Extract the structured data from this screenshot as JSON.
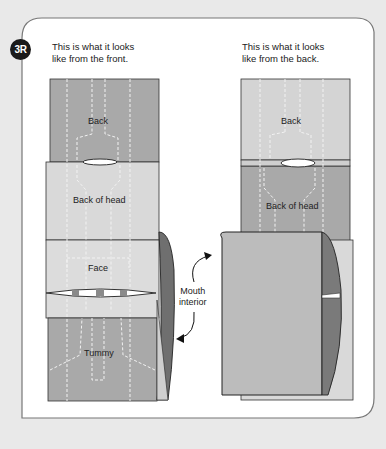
{
  "step": {
    "badge": "3R"
  },
  "front": {
    "caption_line1": "This is what it looks",
    "caption_line2": "like from the front.",
    "labels": {
      "back": "Back",
      "back_of_head": "Back of head",
      "face": "Face",
      "tummy": "Tummy"
    }
  },
  "back_view": {
    "caption_line1": "This is what it looks",
    "caption_line2": "like from the back.",
    "labels": {
      "back": "Back",
      "back_of_head": "Back of head"
    }
  },
  "annotation": {
    "line1": "Mouth",
    "line2": "interior"
  },
  "colors": {
    "background": "#e9e9e9",
    "panel": "#ffffff",
    "paper_dark": "#a9a9a9",
    "paper_light": "#d6d6d6",
    "paper_mid": "#bfbfbf",
    "inside_dark": "#7a7a7a",
    "badge": "#1a1a1a"
  }
}
